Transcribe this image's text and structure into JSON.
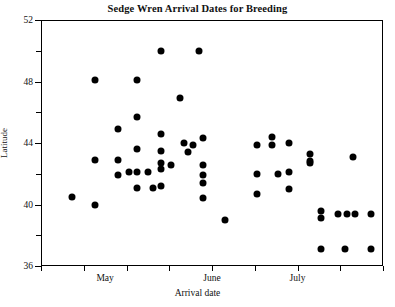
{
  "chart_data": {
    "type": "scatter",
    "title": "Sedge Wren Arrival Dates for Breeding",
    "xlabel": "Arrival date",
    "ylabel": "Latitude",
    "grid": false,
    "legend": null,
    "ylim": [
      36,
      52
    ],
    "yticks": [
      36,
      40,
      44,
      48,
      52
    ],
    "ytick_labels": [
      "36",
      "40",
      "44",
      "48",
      "52"
    ],
    "yminor_ticks": [
      38,
      42,
      46,
      50
    ],
    "xlim": [
      0,
      8
    ],
    "xticks": [
      0,
      1,
      2,
      3,
      4,
      5,
      6,
      7,
      8
    ],
    "xtick_labels": [
      "",
      "",
      "",
      "",
      "",
      "",
      "",
      "",
      ""
    ],
    "xcategory_labels": [
      {
        "label": "May",
        "x": 1.5
      },
      {
        "label": "June",
        "x": 4.0
      },
      {
        "label": "July",
        "x": 6.0
      }
    ],
    "marker": "filled-circle",
    "marker_color": "#000000",
    "marker_size": 7,
    "points": [
      {
        "x": 0.72,
        "y": 40.5
      },
      {
        "x": 1.26,
        "y": 48.1
      },
      {
        "x": 1.26,
        "y": 42.9
      },
      {
        "x": 1.26,
        "y": 40.0
      },
      {
        "x": 1.8,
        "y": 44.9
      },
      {
        "x": 1.8,
        "y": 42.9
      },
      {
        "x": 1.8,
        "y": 41.9
      },
      {
        "x": 2.06,
        "y": 42.1
      },
      {
        "x": 2.25,
        "y": 48.1
      },
      {
        "x": 2.25,
        "y": 45.7
      },
      {
        "x": 2.25,
        "y": 43.6
      },
      {
        "x": 2.25,
        "y": 42.1
      },
      {
        "x": 2.25,
        "y": 41.1
      },
      {
        "x": 2.5,
        "y": 42.1
      },
      {
        "x": 2.62,
        "y": 41.1
      },
      {
        "x": 2.8,
        "y": 50.0
      },
      {
        "x": 2.8,
        "y": 44.6
      },
      {
        "x": 2.8,
        "y": 43.5
      },
      {
        "x": 2.8,
        "y": 42.7
      },
      {
        "x": 2.8,
        "y": 42.3
      },
      {
        "x": 2.8,
        "y": 41.2
      },
      {
        "x": 3.05,
        "y": 42.6
      },
      {
        "x": 3.25,
        "y": 46.9
      },
      {
        "x": 3.35,
        "y": 44.0
      },
      {
        "x": 3.55,
        "y": 43.9
      },
      {
        "x": 3.45,
        "y": 43.4
      },
      {
        "x": 3.7,
        "y": 50.0
      },
      {
        "x": 3.8,
        "y": 44.3
      },
      {
        "x": 3.8,
        "y": 42.6
      },
      {
        "x": 3.8,
        "y": 40.4
      },
      {
        "x": 3.8,
        "y": 41.4
      },
      {
        "x": 3.8,
        "y": 41.9
      },
      {
        "x": 4.3,
        "y": 39.0
      },
      {
        "x": 5.05,
        "y": 43.9
      },
      {
        "x": 5.05,
        "y": 42.0
      },
      {
        "x": 5.05,
        "y": 40.7
      },
      {
        "x": 5.4,
        "y": 44.4
      },
      {
        "x": 5.4,
        "y": 43.9
      },
      {
        "x": 5.55,
        "y": 42.0
      },
      {
        "x": 5.8,
        "y": 44.0
      },
      {
        "x": 5.8,
        "y": 42.1
      },
      {
        "x": 5.8,
        "y": 41.0
      },
      {
        "x": 6.3,
        "y": 43.3
      },
      {
        "x": 6.3,
        "y": 42.8
      },
      {
        "x": 6.3,
        "y": 42.7
      },
      {
        "x": 6.55,
        "y": 39.6
      },
      {
        "x": 6.55,
        "y": 39.1
      },
      {
        "x": 6.55,
        "y": 37.1
      },
      {
        "x": 6.95,
        "y": 39.4
      },
      {
        "x": 7.15,
        "y": 39.4
      },
      {
        "x": 7.35,
        "y": 39.4
      },
      {
        "x": 7.1,
        "y": 37.1
      },
      {
        "x": 7.72,
        "y": 39.4
      },
      {
        "x": 7.72,
        "y": 37.1
      },
      {
        "x": 7.3,
        "y": 43.1
      }
    ]
  }
}
